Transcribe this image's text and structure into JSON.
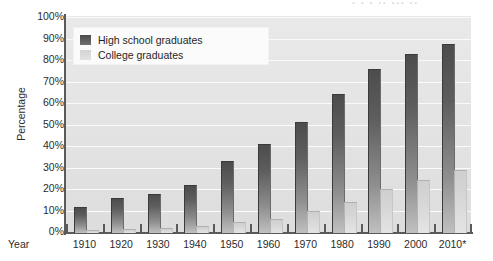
{
  "figure": {
    "cropped_header_fragment": "· · ·  ·· ··· ··",
    "background_color": "#ffffff",
    "plot_background_color": "#e5e5e5",
    "axis_color": "#5a5a5a",
    "gridline_color": "#fafafa"
  },
  "legend": {
    "position": "top-left-inside",
    "entries": [
      {
        "label": "High school graduates",
        "color": "#4f4f4f",
        "swatch": "hs-swatch"
      },
      {
        "label": "College graduates",
        "color": "#d9d9d9",
        "swatch": "college-swatch"
      }
    ]
  },
  "axes": {
    "y_title": "Percentage",
    "x_title": "Year",
    "y_ticks": [
      "0%",
      "10%",
      "20%",
      "30%",
      "40%",
      "50%",
      "60%",
      "70%",
      "80%",
      "90%",
      "100%"
    ],
    "x_ticks": [
      "1910",
      "1920",
      "1930",
      "1940",
      "1950",
      "1960",
      "1970",
      "1980",
      "1990",
      "2000",
      "2010*"
    ]
  },
  "chart_data": {
    "type": "bar",
    "title": "",
    "xlabel": "Year",
    "ylabel": "Percentage",
    "ylim": [
      0,
      100
    ],
    "grid": true,
    "legend_position": "upper left",
    "categories": [
      "1910",
      "1920",
      "1930",
      "1940",
      "1950",
      "1960",
      "1970",
      "1980",
      "1990",
      "2000",
      "2010*"
    ],
    "series": [
      {
        "name": "High school graduates",
        "color": "#4f4f4f",
        "values": [
          11.5,
          16,
          17.5,
          22,
          33,
          41,
          51,
          64,
          76,
          83,
          87.5
        ]
      },
      {
        "name": "College graduates",
        "color": "#d9d9d9",
        "values": [
          1,
          1.5,
          2,
          3,
          4.5,
          6,
          10,
          14,
          20,
          24,
          29
        ]
      }
    ],
    "annotations": [
      "* 2010 value is an estimate/projection as indicated by the asterisk"
    ]
  }
}
